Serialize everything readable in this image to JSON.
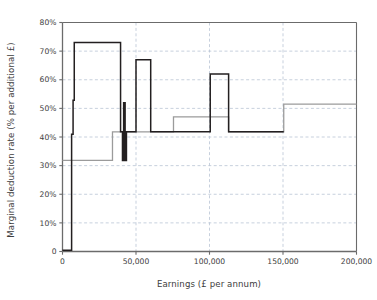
{
  "chart_data": {
    "type": "line",
    "title": "",
    "xlabel": "Earnings (£ per annum)",
    "ylabel": "Marginal deduction rate (% per additional £)",
    "xlim": [
      0,
      200000
    ],
    "ylim": [
      0,
      80
    ],
    "grid": true,
    "legend": "none",
    "xticks": [
      0,
      50000,
      100000,
      150000,
      200000
    ],
    "xtick_labels": [
      "0",
      "50,000",
      "100,000",
      "150,000",
      "200,000"
    ],
    "yticks": [
      0,
      10,
      20,
      30,
      40,
      50,
      60,
      70,
      80
    ],
    "ytick_labels": [
      "0",
      "10%",
      "20%",
      "30%",
      "40%",
      "50%",
      "60%",
      "70%",
      "80%"
    ],
    "series": [
      {
        "name": "black-step-series",
        "color": "#231f20",
        "drawstyle": "steps-post",
        "x": [
          0,
          5500,
          6200,
          7200,
          8000,
          38000,
          39500,
          40800,
          41600,
          42600,
          43500,
          50000,
          60000,
          75500,
          100500,
          113000,
          150500
        ],
        "y": [
          0.4,
          0.4,
          41,
          52.8,
          73,
          73,
          41.8,
          31.8,
          52,
          31.8,
          41.8,
          67,
          41.8,
          41.8,
          62,
          41.8,
          41.8
        ]
      },
      {
        "name": "grey-step-series",
        "color": "#9b9b9b",
        "drawstyle": "steps-post",
        "x": [
          0,
          34000,
          75500,
          113000,
          150500,
          200000
        ],
        "y": [
          31.8,
          41.8,
          47,
          41.8,
          51.5,
          51.5
        ]
      }
    ],
    "annotations": []
  },
  "colors": {
    "black_series": "#231f20",
    "grey_series": "#9b9b9b",
    "axis": "#6b6b6b",
    "grid": "#b9c4d4",
    "text": "#3d3d3d",
    "background": "#ffffff"
  }
}
